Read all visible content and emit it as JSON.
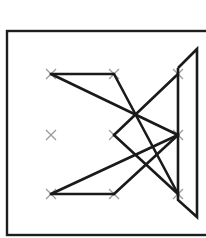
{
  "diagram": {
    "colors": {
      "background": "#ffffff",
      "frame": "#1e1e1e",
      "stroke": "#1a1a1a",
      "node_mark": "#9a9a9a"
    },
    "frame": {
      "x": 7,
      "y": 31,
      "width": 240,
      "height": 204
    },
    "grid": {
      "columns_x": [
        51,
        114,
        178
      ],
      "rows_y": [
        74,
        135,
        194
      ]
    },
    "nodes": [
      {
        "id": "r1c1",
        "x": 51,
        "y": 74
      },
      {
        "id": "r1c2",
        "x": 114,
        "y": 74
      },
      {
        "id": "r1c3",
        "x": 178,
        "y": 74
      },
      {
        "id": "r2c1",
        "x": 51,
        "y": 135
      },
      {
        "id": "r2c2",
        "x": 114,
        "y": 135
      },
      {
        "id": "r2c3",
        "x": 178,
        "y": 135
      },
      {
        "id": "r3c1",
        "x": 51,
        "y": 194
      },
      {
        "id": "r3c2",
        "x": 114,
        "y": 194
      },
      {
        "id": "r3c3",
        "x": 178,
        "y": 194
      }
    ],
    "segments": [
      {
        "x1": 51,
        "y1": 74,
        "x2": 114,
        "y2": 74
      },
      {
        "x1": 114,
        "y1": 74,
        "x2": 178,
        "y2": 194
      },
      {
        "x1": 51,
        "y1": 74,
        "x2": 178,
        "y2": 135
      },
      {
        "x1": 51,
        "y1": 194,
        "x2": 114,
        "y2": 194
      },
      {
        "x1": 114,
        "y1": 194,
        "x2": 178,
        "y2": 135
      },
      {
        "x1": 51,
        "y1": 194,
        "x2": 178,
        "y2": 135
      },
      {
        "x1": 114,
        "y1": 135,
        "x2": 178,
        "y2": 74
      },
      {
        "x1": 114,
        "y1": 135,
        "x2": 178,
        "y2": 194
      }
    ],
    "side_shape": {
      "points": [
        [
          178,
          68
        ],
        [
          197,
          49
        ],
        [
          197,
          217
        ],
        [
          178,
          200
        ],
        [
          178,
          68
        ]
      ]
    }
  }
}
